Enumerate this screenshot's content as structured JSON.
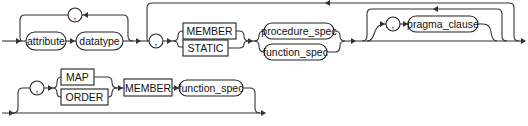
{
  "diagram": {
    "type": "railroad-syntax-diagram",
    "rows": [
      {
        "name": "attribute-and-method-specs",
        "items": [
          {
            "kind": "loop-separator",
            "label": ","
          },
          {
            "kind": "nonterminal",
            "label": "attribute"
          },
          {
            "kind": "nonterminal",
            "label": "datatype"
          },
          {
            "kind": "separator",
            "label": ","
          },
          {
            "kind": "keyword",
            "label": "MEMBER"
          },
          {
            "kind": "keyword",
            "label": "STATIC"
          },
          {
            "kind": "nonterminal",
            "label": "procedure_spec"
          },
          {
            "kind": "nonterminal",
            "label": "function_spec"
          },
          {
            "kind": "separator",
            "label": ","
          },
          {
            "kind": "nonterminal",
            "label": "pragma_clause"
          }
        ]
      },
      {
        "name": "map-order-method",
        "items": [
          {
            "kind": "separator",
            "label": ","
          },
          {
            "kind": "keyword",
            "label": "MAP"
          },
          {
            "kind": "keyword",
            "label": "ORDER"
          },
          {
            "kind": "keyword",
            "label": "MEMBER"
          },
          {
            "kind": "nonterminal",
            "label": "function_spec"
          }
        ]
      }
    ],
    "labels": {
      "comma": ",",
      "attribute": "attribute",
      "datatype": "datatype",
      "member": "MEMBER",
      "static": "STATIC",
      "procedure_spec": "procedure_spec",
      "function_spec": "function_spec",
      "pragma_clause": "pragma_clause",
      "map": "MAP",
      "order": "ORDER"
    },
    "colors": {
      "line": "#333333",
      "text": "#111111",
      "background": "#ffffff"
    }
  }
}
